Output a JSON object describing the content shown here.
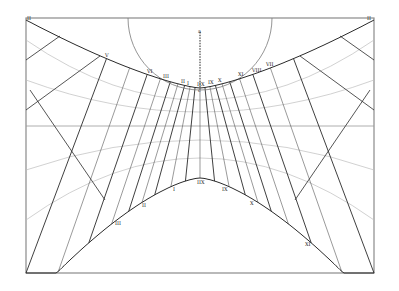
{
  "diagram": {
    "colors": {
      "frame": "#8a8a8a",
      "hour_line": "#2a2a2a",
      "light_line": "#b5b5b5",
      "circle": "#7a7a7a",
      "text": "#222222"
    },
    "gnomon": {
      "top_label": "a",
      "bottom_label": "c"
    },
    "upper_curve_labels": [
      "II",
      "V",
      "VI",
      "III",
      "II",
      "I",
      "IIX",
      "IX",
      "X",
      "XI",
      "VIII",
      "VII",
      "II"
    ],
    "lower_curve_labels": [
      "III",
      "II",
      "I",
      "IIX",
      "IX",
      "X",
      "XI"
    ]
  }
}
